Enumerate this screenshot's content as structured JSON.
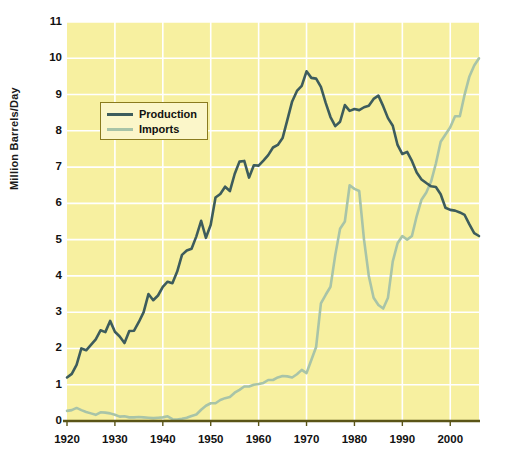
{
  "chart_data": {
    "type": "line",
    "title": "",
    "xlabel": "",
    "ylabel": "Million Barrels/Day",
    "xlim": [
      1920,
      2006
    ],
    "ylim": [
      0,
      11
    ],
    "grid": true,
    "legend_position": "upper-left-inside",
    "xticks": [
      1920,
      1930,
      1940,
      1950,
      1960,
      1970,
      1980,
      1990,
      2000
    ],
    "yticks": [
      0,
      1,
      2,
      3,
      4,
      5,
      6,
      7,
      8,
      9,
      10,
      11
    ],
    "colors": {
      "plot_background": "#f7f0a0",
      "gridline": "#ffffff",
      "axis": "#5a5417",
      "production": "#3d5c5c",
      "imports": "#a8c4a8",
      "legend_background": "#fbf6c9",
      "legend_border": "#8a7b1e",
      "text": "#111111"
    },
    "series": [
      {
        "name": "Production",
        "color": "#3d5c5c",
        "x": [
          1920,
          1921,
          1922,
          1923,
          1924,
          1925,
          1926,
          1927,
          1928,
          1929,
          1930,
          1931,
          1932,
          1933,
          1934,
          1935,
          1936,
          1937,
          1938,
          1939,
          1940,
          1941,
          1942,
          1943,
          1944,
          1945,
          1946,
          1947,
          1948,
          1949,
          1950,
          1951,
          1952,
          1953,
          1954,
          1955,
          1956,
          1957,
          1958,
          1959,
          1960,
          1961,
          1962,
          1963,
          1964,
          1965,
          1966,
          1967,
          1968,
          1969,
          1970,
          1971,
          1972,
          1973,
          1974,
          1975,
          1976,
          1977,
          1978,
          1979,
          1980,
          1981,
          1982,
          1983,
          1984,
          1985,
          1986,
          1987,
          1988,
          1989,
          1990,
          1991,
          1992,
          1993,
          1994,
          1995,
          1996,
          1997,
          1998,
          1999,
          2000,
          2001,
          2002,
          2003,
          2004,
          2005,
          2006
        ],
        "values": [
          1.2,
          1.3,
          1.55,
          2.0,
          1.95,
          2.1,
          2.25,
          2.5,
          2.45,
          2.76,
          2.46,
          2.33,
          2.15,
          2.48,
          2.49,
          2.73,
          3.0,
          3.5,
          3.33,
          3.46,
          3.7,
          3.84,
          3.8,
          4.12,
          4.58,
          4.7,
          4.75,
          5.09,
          5.52,
          5.05,
          5.41,
          6.16,
          6.26,
          6.46,
          6.34,
          6.81,
          7.15,
          7.17,
          6.71,
          7.05,
          7.04,
          7.18,
          7.33,
          7.54,
          7.61,
          7.8,
          8.3,
          8.81,
          9.1,
          9.24,
          9.64,
          9.46,
          9.44,
          9.21,
          8.77,
          8.38,
          8.13,
          8.25,
          8.71,
          8.55,
          8.6,
          8.57,
          8.65,
          8.69,
          8.88,
          8.97,
          8.68,
          8.35,
          8.14,
          7.61,
          7.36,
          7.42,
          7.17,
          6.85,
          6.66,
          6.56,
          6.47,
          6.45,
          6.25,
          5.88,
          5.82,
          5.8,
          5.75,
          5.68,
          5.42,
          5.18,
          5.1
        ]
      },
      {
        "name": "Imports",
        "color": "#a8c4a8",
        "x": [
          1920,
          1921,
          1922,
          1923,
          1924,
          1925,
          1926,
          1927,
          1928,
          1929,
          1930,
          1931,
          1932,
          1933,
          1934,
          1935,
          1936,
          1937,
          1938,
          1939,
          1940,
          1941,
          1942,
          1943,
          1944,
          1945,
          1946,
          1947,
          1948,
          1949,
          1950,
          1951,
          1952,
          1953,
          1954,
          1955,
          1956,
          1957,
          1958,
          1959,
          1960,
          1961,
          1962,
          1963,
          1964,
          1965,
          1966,
          1967,
          1968,
          1969,
          1970,
          1971,
          1972,
          1973,
          1974,
          1975,
          1976,
          1977,
          1978,
          1979,
          1980,
          1981,
          1982,
          1983,
          1984,
          1985,
          1986,
          1987,
          1988,
          1989,
          1990,
          1991,
          1992,
          1993,
          1994,
          1995,
          1996,
          1997,
          1998,
          1999,
          2000,
          2001,
          2002,
          2003,
          2004,
          2005,
          2006
        ],
        "values": [
          0.28,
          0.3,
          0.36,
          0.3,
          0.25,
          0.21,
          0.17,
          0.24,
          0.23,
          0.21,
          0.17,
          0.12,
          0.13,
          0.1,
          0.1,
          0.11,
          0.1,
          0.09,
          0.08,
          0.09,
          0.1,
          0.13,
          0.05,
          0.04,
          0.06,
          0.09,
          0.14,
          0.18,
          0.31,
          0.42,
          0.49,
          0.49,
          0.58,
          0.63,
          0.66,
          0.78,
          0.86,
          0.95,
          0.95,
          1.0,
          1.02,
          1.05,
          1.13,
          1.13,
          1.2,
          1.24,
          1.23,
          1.2,
          1.29,
          1.41,
          1.32,
          1.68,
          2.04,
          3.24,
          3.48,
          3.7,
          4.58,
          5.3,
          5.5,
          6.5,
          6.4,
          6.34,
          5.0,
          4.0,
          3.4,
          3.2,
          3.1,
          3.4,
          4.4,
          4.9,
          5.1,
          5.0,
          5.1,
          5.65,
          6.1,
          6.3,
          6.6,
          7.1,
          7.7,
          7.9,
          8.1,
          8.4,
          8.4,
          9.0,
          9.5,
          9.8,
          10.0
        ]
      }
    ]
  },
  "legend": {
    "items": [
      {
        "label": "Production"
      },
      {
        "label": "Imports"
      }
    ]
  },
  "axes": {
    "y_axis_title": "Million Barrels/Day"
  }
}
